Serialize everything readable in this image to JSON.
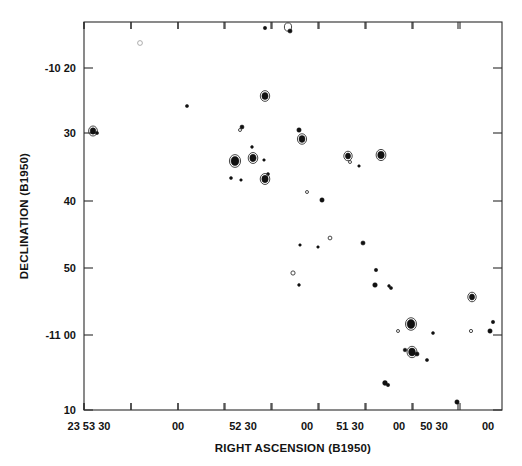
{
  "figure": {
    "kind": "radio-contour-map",
    "background_color": "#ffffff",
    "ink_color": "#111111"
  },
  "chart_data": {
    "type": "scatter",
    "title": "",
    "subtitle": "",
    "xlabel": "RIGHT ASCENSION (B1950)",
    "ylabel": "DECLINATION (B1950)",
    "grid": false,
    "legend": null,
    "x_axis": {
      "label": "RIGHT ASCENSION (B1950)",
      "direction": "decreasing-right",
      "tick_labels": [
        "23 53 30",
        "00",
        "52 30",
        "00",
        "51 30",
        "00",
        "50 30",
        "00"
      ],
      "tick_values_seconds": [
        3210,
        3180,
        3150,
        3120,
        3090,
        3060,
        3030,
        3000
      ],
      "minor_ticks_between": 1,
      "range_label": [
        "23 53 40",
        "23 49 50"
      ]
    },
    "y_axis": {
      "label": "DECLINATION (B1950)",
      "tick_labels": [
        "-10 20",
        "30",
        "40",
        "50",
        "-11 00",
        "10"
      ],
      "tick_values_arcmin": [
        -620,
        -630,
        -640,
        -650,
        -660,
        -670
      ],
      "direction": "decreasing-down",
      "range_label": [
        "-10 13",
        "-11 10"
      ]
    },
    "marker_kinds": [
      "filled",
      "open",
      "faint"
    ],
    "point_count": 48,
    "points": [
      {
        "x": 140,
        "y": 43,
        "r": 2.4,
        "kind": "faint"
      },
      {
        "x": 265,
        "y": 28,
        "r": 1.7,
        "kind": "filled"
      },
      {
        "x": 288,
        "y": 27,
        "r": 3.6,
        "kind": "open"
      },
      {
        "x": 290,
        "y": 31,
        "r": 2.1,
        "kind": "filled"
      },
      {
        "x": 187,
        "y": 106,
        "r": 1.6,
        "kind": "filled"
      },
      {
        "x": 265,
        "y": 96,
        "r": 3.1,
        "kind": "filled"
      },
      {
        "x": 242,
        "y": 127,
        "r": 2.0,
        "kind": "filled"
      },
      {
        "x": 93,
        "y": 131,
        "r": 2.8,
        "kind": "filled"
      },
      {
        "x": 97,
        "y": 133,
        "r": 1.6,
        "kind": "filled"
      },
      {
        "x": 240,
        "y": 130,
        "r": 1.5,
        "kind": "open"
      },
      {
        "x": 299,
        "y": 130,
        "r": 2.2,
        "kind": "filled"
      },
      {
        "x": 302,
        "y": 139,
        "r": 3.0,
        "kind": "filled"
      },
      {
        "x": 252,
        "y": 147,
        "r": 1.4,
        "kind": "filled"
      },
      {
        "x": 235,
        "y": 161,
        "r": 4.0,
        "kind": "filled"
      },
      {
        "x": 253,
        "y": 158,
        "r": 3.2,
        "kind": "filled"
      },
      {
        "x": 264,
        "y": 160,
        "r": 1.3,
        "kind": "filled"
      },
      {
        "x": 268,
        "y": 174,
        "r": 1.5,
        "kind": "filled"
      },
      {
        "x": 265,
        "y": 179,
        "r": 3.2,
        "kind": "filled"
      },
      {
        "x": 231,
        "y": 178,
        "r": 1.5,
        "kind": "filled"
      },
      {
        "x": 241,
        "y": 180,
        "r": 1.3,
        "kind": "filled"
      },
      {
        "x": 348,
        "y": 156,
        "r": 2.6,
        "kind": "filled"
      },
      {
        "x": 350,
        "y": 162,
        "r": 1.5,
        "kind": "open"
      },
      {
        "x": 381,
        "y": 155,
        "r": 3.3,
        "kind": "filled"
      },
      {
        "x": 359,
        "y": 166,
        "r": 1.3,
        "kind": "filled"
      },
      {
        "x": 307,
        "y": 192,
        "r": 1.5,
        "kind": "open"
      },
      {
        "x": 322,
        "y": 200,
        "r": 2.2,
        "kind": "filled"
      },
      {
        "x": 330,
        "y": 238,
        "r": 1.9,
        "kind": "open"
      },
      {
        "x": 300,
        "y": 245,
        "r": 1.3,
        "kind": "filled"
      },
      {
        "x": 318,
        "y": 247,
        "r": 1.3,
        "kind": "filled"
      },
      {
        "x": 363,
        "y": 243,
        "r": 2.1,
        "kind": "filled"
      },
      {
        "x": 293,
        "y": 273,
        "r": 2.1,
        "kind": "open"
      },
      {
        "x": 299,
        "y": 285,
        "r": 1.4,
        "kind": "filled"
      },
      {
        "x": 376,
        "y": 270,
        "r": 1.7,
        "kind": "filled"
      },
      {
        "x": 375,
        "y": 285,
        "r": 2.3,
        "kind": "filled"
      },
      {
        "x": 391,
        "y": 288,
        "r": 1.6,
        "kind": "filled"
      },
      {
        "x": 472,
        "y": 297,
        "r": 2.6,
        "kind": "filled"
      },
      {
        "x": 389,
        "y": 286,
        "r": 1.4,
        "kind": "filled"
      },
      {
        "x": 411,
        "y": 324,
        "r": 3.9,
        "kind": "filled"
      },
      {
        "x": 398,
        "y": 331,
        "r": 1.5,
        "kind": "open"
      },
      {
        "x": 433,
        "y": 333,
        "r": 1.5,
        "kind": "filled"
      },
      {
        "x": 493,
        "y": 322,
        "r": 1.7,
        "kind": "filled"
      },
      {
        "x": 471,
        "y": 331,
        "r": 1.6,
        "kind": "open"
      },
      {
        "x": 490,
        "y": 331,
        "r": 2.2,
        "kind": "filled"
      },
      {
        "x": 405,
        "y": 350,
        "r": 1.8,
        "kind": "filled"
      },
      {
        "x": 412,
        "y": 352,
        "r": 3.4,
        "kind": "filled"
      },
      {
        "x": 417,
        "y": 354,
        "r": 2.1,
        "kind": "filled"
      },
      {
        "x": 427,
        "y": 360,
        "r": 1.6,
        "kind": "filled"
      },
      {
        "x": 385,
        "y": 383,
        "r": 2.4,
        "kind": "filled"
      },
      {
        "x": 388,
        "y": 385,
        "r": 1.7,
        "kind": "filled"
      },
      {
        "x": 457,
        "y": 402,
        "r": 2.2,
        "kind": "filled"
      }
    ]
  },
  "plot_box": {
    "left": 84,
    "right": 502,
    "top": 22,
    "bottom": 410
  },
  "x_ticks": [
    {
      "px": 84,
      "label": "23 53 30",
      "major": true
    },
    {
      "px": 131,
      "label": "",
      "major": false
    },
    {
      "px": 178,
      "label": "00",
      "major": true
    },
    {
      "px": 225,
      "label": "",
      "major": false
    },
    {
      "px": 272,
      "label": "52 30",
      "major": true
    },
    {
      "px": 319,
      "label": "",
      "major": false
    },
    {
      "px": 366,
      "label": "00",
      "major": true
    },
    {
      "px": 413,
      "label": "",
      "major": false
    },
    {
      "px": 460,
      "label": "51 30",
      "major": true
    }
  ],
  "x_tick_labels_row": [
    {
      "px": 89,
      "text": "23 53 30"
    },
    {
      "px": 178,
      "text": "00"
    },
    {
      "px": 243,
      "text": "52 30"
    },
    {
      "px": 307,
      "text": "00"
    },
    {
      "px": 350,
      "text": "51 30"
    },
    {
      "px": 399,
      "text": "00"
    },
    {
      "px": 434,
      "text": "50 30"
    },
    {
      "px": 488,
      "text": "00"
    }
  ],
  "y_ticks": [
    {
      "px": 68,
      "label": "-10 20"
    },
    {
      "px": 133,
      "label": "30"
    },
    {
      "px": 201,
      "label": "40"
    },
    {
      "px": 268,
      "label": "50"
    },
    {
      "px": 335,
      "label": "-11 00"
    },
    {
      "px": 410,
      "label": "10"
    }
  ]
}
